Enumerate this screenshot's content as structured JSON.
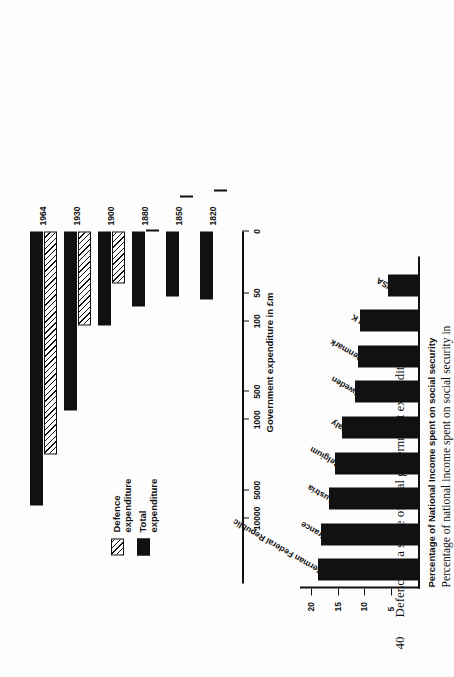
{
  "page": {
    "figure_number": "40",
    "figure_title": "Defence as a share of total government expenditure"
  },
  "chart_data": [
    {
      "type": "bar",
      "orientation": "horizontal",
      "id": "government-expenditure",
      "title": "Defence as a share of total government expenditure",
      "xlabel": "Government expenditure in £m",
      "ylabel": "",
      "scale": "log",
      "xlim": [
        0,
        10000
      ],
      "tick_labels": [
        "0",
        "50",
        "100",
        "500",
        "1000",
        "5000",
        "10000"
      ],
      "tick_values": [
        0,
        50,
        100,
        500,
        1000,
        5000,
        10000
      ],
      "grid": false,
      "legend_position": "upper-left",
      "categories": [
        "1820",
        "1850",
        "1880",
        "1900",
        "1930",
        "1964"
      ],
      "series": [
        {
          "name": "Total expenditure",
          "pattern": "solid",
          "color": "#111111",
          "values": [
            58,
            55,
            70,
            110,
            800,
            7200
          ]
        },
        {
          "name": "Defence expenditure",
          "pattern": "hatched",
          "color": "#111111",
          "values": [
            16,
            17,
            25,
            45,
            110,
            2200
          ]
        }
      ]
    },
    {
      "type": "bar",
      "orientation": "vertical",
      "id": "social-security",
      "title": "Percentage of National Income spent on social security",
      "caption_line1": "Percentage of national income spent on social security in",
      "caption_line2": "various countries, 1950s",
      "xlabel": "",
      "ylabel": "Percentage of National Income spent on social security",
      "ylim": [
        0,
        22
      ],
      "tick_labels": [
        "5",
        "10",
        "15",
        "20"
      ],
      "tick_values": [
        5,
        10,
        15,
        20
      ],
      "grid": false,
      "bar_color": "#111111",
      "categories": [
        "German Federal Republic",
        "France",
        "Austria",
        "Belgium",
        "Italy",
        "Sweden",
        "Denmark",
        "U K",
        "USA"
      ],
      "values": [
        18.6,
        18.0,
        16.6,
        15.5,
        14.2,
        11.7,
        11.1,
        10.8,
        5.6
      ]
    }
  ],
  "chart1": {
    "axis_label": "Government expenditure in £m",
    "legend": [
      {
        "label": "Defence expenditure",
        "swatch": "hatch"
      },
      {
        "label": "Total expenditure",
        "swatch": "solid"
      }
    ],
    "ticks": [
      {
        "label": "0"
      },
      {
        "label": "50"
      },
      {
        "label": "100"
      },
      {
        "label": "500"
      },
      {
        "label": "1000"
      },
      {
        "label": "5000"
      },
      {
        "label": "10000"
      }
    ],
    "years": [
      "1820",
      "1850",
      "1880",
      "1900",
      "1930",
      "1964"
    ]
  },
  "chart2": {
    "axis_title": "Percentage of National Income spent on social security",
    "caption_line1": "Percentage of national income spent on social security in",
    "caption_line2": "various countries, 1950s",
    "ticks": [
      {
        "label": "5"
      },
      {
        "label": "10"
      },
      {
        "label": "15"
      },
      {
        "label": "20"
      }
    ],
    "countries": [
      "German Federal Republic",
      "France",
      "Austria",
      "Belgium",
      "Italy",
      "Sweden",
      "Denmark",
      "U K",
      "USA"
    ]
  }
}
